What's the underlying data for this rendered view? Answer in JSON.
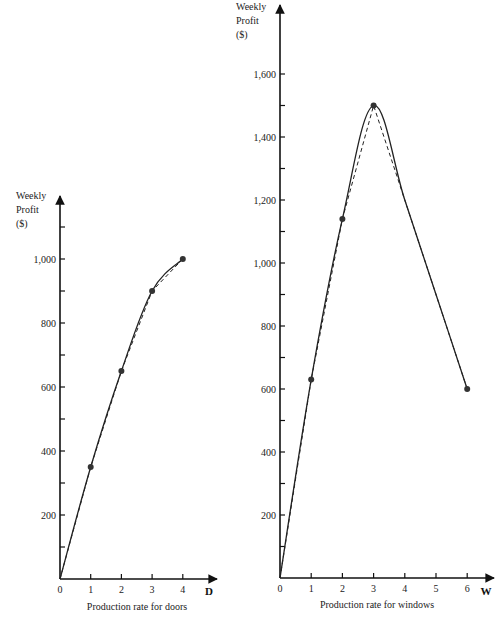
{
  "chart_data": [
    {
      "type": "line",
      "title": "",
      "xlabel": "Production rate for doors",
      "x_variable": "D",
      "ylabel": "Weekly Profit ($)",
      "ylabel_lines": [
        "Weekly",
        "Profit",
        "($)"
      ],
      "xlim": [
        0,
        4.8
      ],
      "ylim": [
        0,
        1150
      ],
      "x_ticks": [
        0,
        1,
        2,
        3,
        4
      ],
      "x_tick_labels": [
        "0",
        "1",
        "2",
        "3",
        "4"
      ],
      "y_ticks": [
        100,
        200,
        300,
        400,
        500,
        600,
        700,
        800,
        900,
        1000,
        1100
      ],
      "y_tick_labels": [
        "",
        "200",
        "",
        "400",
        "",
        "600",
        "",
        "800",
        "",
        "1,000",
        ""
      ],
      "grid": false,
      "series": [
        {
          "name": "profit-curve",
          "style": "solid",
          "x": [
            0,
            1,
            2,
            3,
            4
          ],
          "y": [
            0,
            350,
            650,
            900,
            1000
          ],
          "smooth": true
        },
        {
          "name": "piecewise-linear-approximation",
          "style": "dashed",
          "x": [
            0,
            1,
            2,
            3,
            4
          ],
          "y": [
            0,
            350,
            650,
            900,
            1000
          ]
        }
      ],
      "points": {
        "x": [
          1,
          2,
          3,
          4
        ],
        "y": [
          350,
          650,
          900,
          1000
        ]
      }
    },
    {
      "type": "line",
      "title": "",
      "xlabel": "Production rate for windows",
      "x_variable": "W",
      "ylabel": "Weekly Profit ($)",
      "ylabel_lines": [
        "Weekly",
        "Profit",
        "($)"
      ],
      "xlim": [
        0,
        6.8
      ],
      "ylim": [
        0,
        1800
      ],
      "x_ticks": [
        0,
        1,
        2,
        3,
        4,
        5,
        6
      ],
      "x_tick_labels": [
        "0",
        "1",
        "2",
        "3",
        "4",
        "5",
        "6"
      ],
      "y_ticks": [
        100,
        200,
        300,
        400,
        500,
        600,
        700,
        800,
        900,
        1000,
        1100,
        1200,
        1300,
        1400,
        1500,
        1600
      ],
      "y_tick_labels": [
        "",
        "200",
        "",
        "400",
        "",
        "600",
        "",
        "800",
        "",
        "1,000",
        "",
        "1,200",
        "",
        "1,400",
        "",
        "1,600"
      ],
      "grid": false,
      "series": [
        {
          "name": "profit-curve",
          "style": "solid",
          "x": [
            0,
            1,
            2,
            3,
            4,
            5,
            6
          ],
          "y": [
            0,
            630,
            1140,
            1500,
            1200,
            900,
            600
          ],
          "smooth": true
        },
        {
          "name": "piecewise-linear-approximation",
          "style": "dashed",
          "x": [
            0,
            1,
            2,
            3,
            6
          ],
          "y": [
            0,
            630,
            1140,
            1500,
            600
          ]
        }
      ],
      "points": {
        "x": [
          1,
          2,
          3,
          6
        ],
        "y": [
          630,
          1140,
          1500,
          600
        ]
      }
    }
  ]
}
